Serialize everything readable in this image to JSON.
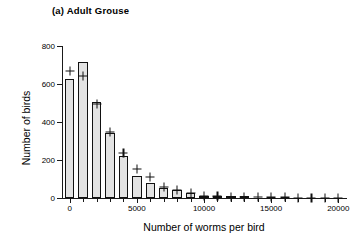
{
  "panel": {
    "title": "(a) Adult Grouse"
  },
  "chart_data": {
    "type": "bar",
    "title": "(a) Adult Grouse",
    "xlabel": "Number of worms per bird",
    "ylabel": "Number of birds",
    "xlim": [
      -500,
      20500
    ],
    "ylim": [
      0,
      800
    ],
    "grid": false,
    "legend": null,
    "bin_width": 1000,
    "categories": [
      "0",
      "1000",
      "2000",
      "3000",
      "4000",
      "5000",
      "6000",
      "7000",
      "8000",
      "9000",
      "10000",
      "11000",
      "12000",
      "13000",
      "14000",
      "15000",
      "16000",
      "17000",
      "18000",
      "19000",
      "20000"
    ],
    "x": [
      0,
      1000,
      2000,
      3000,
      4000,
      5000,
      6000,
      7000,
      8000,
      9000,
      10000,
      11000,
      12000,
      13000,
      14000,
      15000,
      16000,
      17000,
      18000,
      19000,
      20000
    ],
    "series": [
      {
        "name": "Observed number of birds",
        "values": [
          625,
          715,
          505,
          340,
          222,
          115,
          80,
          52,
          40,
          24,
          10,
          6,
          5,
          4,
          3,
          2,
          2,
          0,
          0,
          0,
          0
        ]
      },
      {
        "name": "Fitted (negative binomial) expectation",
        "marker": "plus",
        "values": [
          668,
          642,
          497,
          348,
          236,
          152,
          110,
          58,
          42,
          26,
          12,
          8,
          6,
          5,
          4,
          3,
          3,
          2,
          2,
          1,
          1
        ]
      }
    ],
    "yticks": [
      0,
      200,
      400,
      600,
      800
    ],
    "ytick_labels": [
      "0",
      "200",
      "400",
      "600",
      "800"
    ],
    "xticks": [
      0,
      5000,
      10000,
      15000,
      20000
    ],
    "xtick_labels": [
      "0",
      "5000",
      "10000",
      "15000",
      "20000"
    ],
    "colors": {
      "bar_fill": "#e3e3e3",
      "bar_edge": "#111111",
      "axis": "#1a1a1a",
      "marker": "#111111"
    }
  }
}
